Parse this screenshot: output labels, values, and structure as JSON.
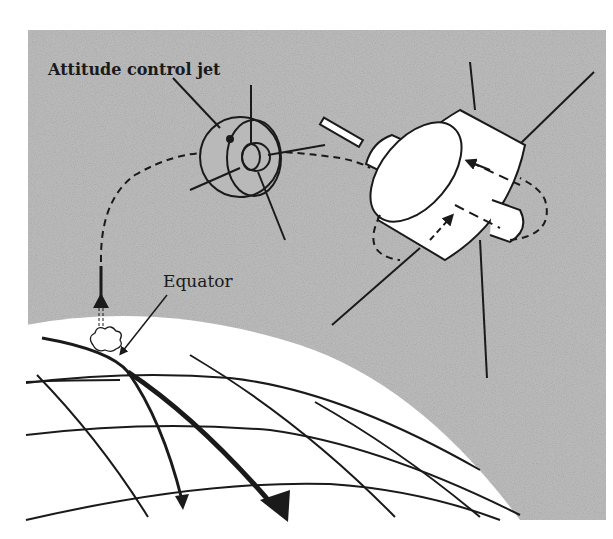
{
  "figure": {
    "type": "illustration",
    "labels": {
      "attitude_jet": "Attitude control jet",
      "equator": "Equator"
    },
    "colors": {
      "space_background": "#b9b9b9",
      "globe": "#ffffff",
      "ink": "#1a1a1a",
      "page": "#ffffff"
    }
  }
}
